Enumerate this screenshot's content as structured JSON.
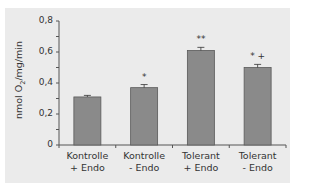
{
  "chart_data": {
    "type": "bar",
    "title": "",
    "xlabel": "",
    "ylabel": "nmol O2/mg/min",
    "ylabel_parts": {
      "pre": "nmol O",
      "sub": "2",
      "post": "/mg/min"
    },
    "ylim": [
      0,
      0.8
    ],
    "yticks": [
      0,
      0.2,
      0.4,
      0.6,
      0.8
    ],
    "ytick_labels": [
      "0",
      "0,2",
      "0,4",
      "0,6",
      "0,8"
    ],
    "categories": [
      "Kontrolle + Endo",
      "Kontrolle - Endo",
      "Tolerant + Endo",
      "Tolerant - Endo"
    ],
    "category_lines": [
      [
        "Kontrolle",
        "+ Endo"
      ],
      [
        "Kontrolle",
        "- Endo"
      ],
      [
        "Tolerant",
        "+ Endo"
      ],
      [
        "Tolerant",
        "- Endo"
      ]
    ],
    "values": [
      0.31,
      0.37,
      0.61,
      0.5
    ],
    "errors": [
      0.01,
      0.02,
      0.02,
      0.02
    ],
    "annotations": [
      "",
      "*",
      "**",
      "* +"
    ],
    "grid": false,
    "legend": null,
    "colors": {
      "bar": "#8a8a8a",
      "bar_edge": "#5a5a5a",
      "axis": "#555555",
      "panel": "#ebebeb"
    }
  }
}
